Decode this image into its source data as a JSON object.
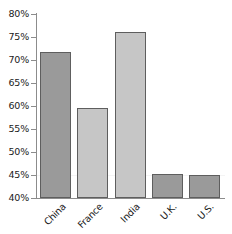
{
  "chart_data": {
    "type": "bar",
    "title": "",
    "subtitle": "",
    "xlabel": "",
    "ylabel": "",
    "categories": [
      "China",
      "France",
      "India",
      "U.K.",
      "U.S."
    ],
    "values": [
      71.8,
      59.5,
      76.0,
      45.3,
      45.1
    ],
    "value_labels": [
      "71.8%",
      "59.5%",
      "76.0%",
      "45.3%",
      "45.1%"
    ],
    "ylim": [
      40,
      80
    ],
    "ytick_values": [
      40,
      45,
      50,
      55,
      60,
      65,
      70,
      75,
      80
    ],
    "ytick_labels": [
      "40%",
      "45%",
      "50%",
      "55%",
      "60%",
      "65%",
      "70%",
      "75%",
      "80%"
    ],
    "grid": true,
    "gridline_values": [
      45
    ],
    "legend": null,
    "legend_position": "none",
    "bar_colors": [
      "#9a9a9a",
      "#c6c6c6",
      "#c6c6c6",
      "#9a9a9a",
      "#9a9a9a"
    ],
    "bar_border_color": "#5e5e5e",
    "axis_color": "#8c8c8c",
    "text_color": "#1a1a1a",
    "background_color": "#ffffff",
    "xtick_label_rotation": -45
  }
}
